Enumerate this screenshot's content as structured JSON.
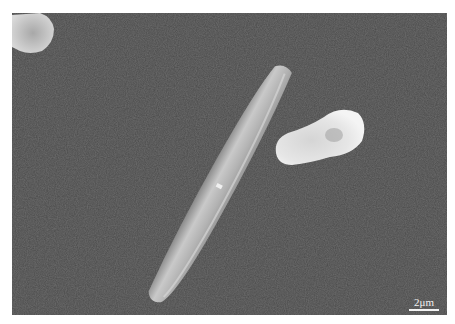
{
  "image": {
    "type": "SEM micrograph",
    "description": "Elongated rod-shaped crystal with a small rounded particle on a dark textured substrate",
    "background_color": "#4a4a4a",
    "frame_color": "#ffffff"
  },
  "scale_bar": {
    "label": "2μm",
    "color": "#f2f2f2"
  },
  "objects": [
    {
      "name": "rod-crystal",
      "color": "#b8b8b8"
    },
    {
      "name": "rounded-particle",
      "color": "#dcdcdc"
    },
    {
      "name": "corner-particle",
      "color": "#c8c8c8"
    }
  ]
}
